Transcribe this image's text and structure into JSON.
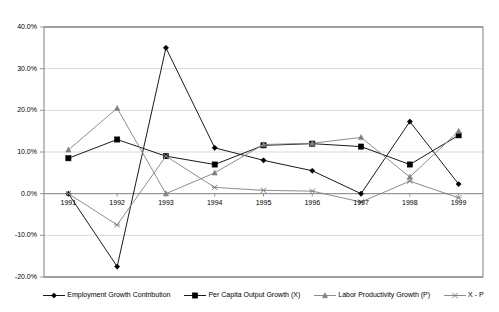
{
  "chart_data": {
    "type": "line",
    "title": "",
    "xlabel": "",
    "ylabel": "",
    "categories": [
      "1991",
      "1992",
      "1993",
      "1994",
      "1995",
      "1996",
      "1997",
      "1998",
      "1999"
    ],
    "ylim": [
      -20,
      40
    ],
    "ytick_labels": [
      "40.0%",
      "30.0%",
      "20.0%",
      "10.0%",
      "0.0%",
      "-10.0%",
      "-20.0%"
    ],
    "ytick_values": [
      40,
      30,
      20,
      10,
      0,
      -10,
      -20
    ],
    "grid": true,
    "legend_position": "bottom",
    "series": [
      {
        "name": "Employment Growth Contribution",
        "marker": "diamond",
        "color": "#000000",
        "values": [
          0.0,
          -17.5,
          35.0,
          11.0,
          8.0,
          5.5,
          0.0,
          17.3,
          2.3
        ]
      },
      {
        "name": "Per Capita Output Growth (X)",
        "marker": "square",
        "color": "#000000",
        "values": [
          8.5,
          13.0,
          9.0,
          7.0,
          11.6,
          12.0,
          11.3,
          7.0,
          14.0
        ]
      },
      {
        "name": "Labor Productivity Growth (P)",
        "marker": "triangle",
        "color": "#808080",
        "values": [
          10.5,
          20.5,
          0.0,
          5.0,
          11.8,
          12.1,
          13.5,
          4.0,
          15.0
        ]
      },
      {
        "name": "X - P",
        "marker": "cross",
        "color": "#808080",
        "values": [
          0.0,
          -7.5,
          9.0,
          1.5,
          0.8,
          0.6,
          -2.0,
          3.0,
          -1.0
        ]
      }
    ]
  },
  "legend": {
    "items": [
      {
        "label": "Employment Growth Contribution",
        "marker": "diamond-marker-icon"
      },
      {
        "label": "Per Capita Output Growth (X)",
        "marker": "square-marker-icon"
      },
      {
        "label": "Labor Productivity Growth (P)",
        "marker": "triangle-marker-icon"
      },
      {
        "label": "X - P",
        "marker": "cross-marker-icon"
      }
    ]
  },
  "colors": {
    "series_dark": "#000000",
    "series_gray": "#808080",
    "grid": "#c8c8c8",
    "axis": "#808080",
    "background": "#ffffff"
  }
}
